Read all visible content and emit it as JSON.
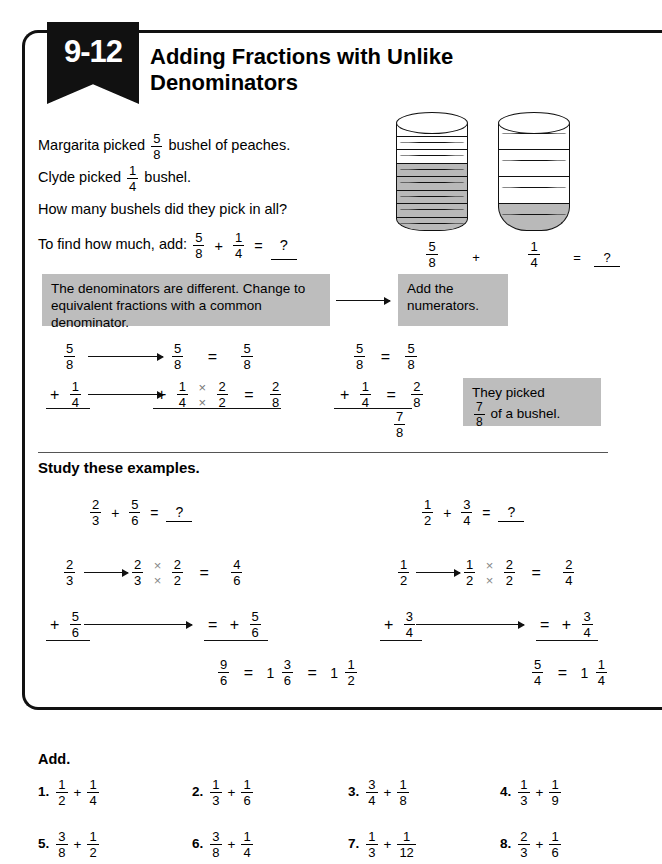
{
  "lesson": {
    "number": "9-12",
    "title": "Adding Fractions with Unlike Denominators"
  },
  "problem": {
    "line1_a": "Margarita picked",
    "line1_frac": {
      "n": "5",
      "d": "8"
    },
    "line1_b": "bushel of peaches.",
    "line2_a": "Clyde picked",
    "line2_frac": {
      "n": "1",
      "d": "4"
    },
    "line2_b": "bushel.",
    "line3": "How many bushels did they pick in all?",
    "line4_a": "To find how much, add:",
    "line4_f1": {
      "n": "5",
      "d": "8"
    },
    "line4_plus": "+",
    "line4_f2": {
      "n": "1",
      "d": "4"
    },
    "line4_eq": "=",
    "line4_answer": "?"
  },
  "bushels": {
    "left": {
      "total": 8,
      "shaded": 5,
      "label": {
        "n": "5",
        "d": "8"
      }
    },
    "right": {
      "total": 4,
      "shaded": 1,
      "label": {
        "n": "1",
        "d": "4"
      }
    },
    "plus": "+",
    "equals": "=",
    "result": "?"
  },
  "callouts": {
    "box1": "The denominators are different. Change to equivalent fractions with a common denominator.",
    "box2": "Add the numerators.",
    "box3_line1": "They picked",
    "box3_frac": {
      "n": "7",
      "d": "8"
    },
    "box3_line2": "of a bushel."
  },
  "worked_example": {
    "left": {
      "r1_start": {
        "n": "5",
        "d": "8"
      },
      "r1_mid": {
        "n": "5",
        "d": "8"
      },
      "r1_eq": "=",
      "r1_end": {
        "n": "5",
        "d": "8"
      },
      "r2_plus": "+",
      "r2_start": {
        "n": "1",
        "d": "4"
      },
      "r2_mid_num": "1",
      "r2_mid_den": "4",
      "r2_times": "×",
      "r2_mul_num": "2",
      "r2_mul_den": "2",
      "r2_eq": "=",
      "r2_end": {
        "n": "2",
        "d": "8"
      }
    },
    "right": {
      "r1": {
        "n": "5",
        "d": "8"
      },
      "r1_eq": "=",
      "r1_res": {
        "n": "5",
        "d": "8"
      },
      "r2_plus": "+",
      "r2": {
        "n": "1",
        "d": "4"
      },
      "r2_eq": "=",
      "r2_res": {
        "n": "2",
        "d": "8"
      },
      "sum": {
        "n": "7",
        "d": "8"
      }
    }
  },
  "study": {
    "heading": "Study these examples.",
    "example1": {
      "header": {
        "f1": {
          "n": "2",
          "d": "3"
        },
        "plus": "+",
        "f2": {
          "n": "5",
          "d": "6"
        },
        "eq": "=",
        "answer": "?"
      },
      "r1_start": {
        "n": "2",
        "d": "3"
      },
      "r1_num": "2",
      "r1_den": "3",
      "r1_times": "×",
      "r1_mul_num": "2",
      "r1_mul_den": "2",
      "r1_eq": "=",
      "r1_res": {
        "n": "4",
        "d": "6"
      },
      "r2_plus": "+",
      "r2_start": {
        "n": "5",
        "d": "6"
      },
      "r2_eq": "=",
      "r2_plus2": "+",
      "r2_res": {
        "n": "5",
        "d": "6"
      },
      "sum": {
        "n": "9",
        "d": "6"
      },
      "sum_eq1": "=",
      "mixed1_whole": "1",
      "mixed1_frac": {
        "n": "3",
        "d": "6"
      },
      "sum_eq2": "=",
      "mixed2_whole": "1",
      "mixed2_frac": {
        "n": "1",
        "d": "2"
      }
    },
    "example2": {
      "header": {
        "f1": {
          "n": "1",
          "d": "2"
        },
        "plus": "+",
        "f2": {
          "n": "3",
          "d": "4"
        },
        "eq": "=",
        "answer": "?"
      },
      "r1_start": {
        "n": "1",
        "d": "2"
      },
      "r1_num": "1",
      "r1_den": "2",
      "r1_times": "×",
      "r1_mul_num": "2",
      "r1_mul_den": "2",
      "r1_eq": "=",
      "r1_res": {
        "n": "2",
        "d": "4"
      },
      "r2_plus": "+",
      "r2_start": {
        "n": "3",
        "d": "4"
      },
      "r2_eq": "=",
      "r2_plus2": "+",
      "r2_res": {
        "n": "3",
        "d": "4"
      },
      "sum": {
        "n": "5",
        "d": "4"
      },
      "sum_eq1": "=",
      "mixed1_whole": "1",
      "mixed1_frac": {
        "n": "1",
        "d": "4"
      }
    }
  },
  "exercises": {
    "heading": "Add.",
    "items": [
      {
        "num": "1.",
        "f1": {
          "n": "1",
          "d": "2"
        },
        "op": "+",
        "f2": {
          "n": "1",
          "d": "4"
        }
      },
      {
        "num": "2.",
        "f1": {
          "n": "1",
          "d": "3"
        },
        "op": "+",
        "f2": {
          "n": "1",
          "d": "6"
        }
      },
      {
        "num": "3.",
        "f1": {
          "n": "3",
          "d": "4"
        },
        "op": "+",
        "f2": {
          "n": "1",
          "d": "8"
        }
      },
      {
        "num": "4.",
        "f1": {
          "n": "1",
          "d": "3"
        },
        "op": "+",
        "f2": {
          "n": "1",
          "d": "9"
        }
      },
      {
        "num": "5.",
        "f1": {
          "n": "3",
          "d": "8"
        },
        "op": "+",
        "f2": {
          "n": "1",
          "d": "2"
        }
      },
      {
        "num": "6.",
        "f1": {
          "n": "3",
          "d": "8"
        },
        "op": "+",
        "f2": {
          "n": "1",
          "d": "4"
        }
      },
      {
        "num": "7.",
        "f1": {
          "n": "1",
          "d": "3"
        },
        "op": "+",
        "f2": {
          "n": "1",
          "d": "12"
        }
      },
      {
        "num": "8.",
        "f1": {
          "n": "2",
          "d": "3"
        },
        "op": "+",
        "f2": {
          "n": "1",
          "d": "6"
        }
      }
    ]
  },
  "colors": {
    "shaded_gray": "#b9b9b9",
    "callout_gray": "#bdbdbd",
    "ink": "#111111"
  }
}
